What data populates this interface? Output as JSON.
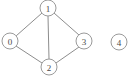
{
  "diagram": {
    "type": "undirected-graph",
    "title": "",
    "width": 133,
    "height": 80,
    "background_color": "#ffffff",
    "node_fill_color": "#ffffff",
    "node_stroke_color": "#9a9a9a",
    "node_label_color": "#4a4a4a",
    "edge_color": "#8d8d8d",
    "node_radius": 8,
    "nodes": [
      {
        "id": "0",
        "label": "0",
        "cx": 10,
        "cy": 41,
        "r": 8
      },
      {
        "id": "1",
        "label": "1",
        "cx": 48,
        "cy": 8,
        "r": 8
      },
      {
        "id": "2",
        "label": "2",
        "cx": 49,
        "cy": 67,
        "r": 8
      },
      {
        "id": "3",
        "label": "3",
        "cx": 84,
        "cy": 41,
        "r": 8
      },
      {
        "id": "4",
        "label": "4",
        "cx": 119,
        "cy": 42,
        "r": 8
      }
    ],
    "edges": [
      {
        "source": "0",
        "target": "1",
        "x1": 16,
        "y1": 36,
        "x2": 42,
        "y2": 13
      },
      {
        "source": "0",
        "target": "2",
        "x1": 16,
        "y1": 46,
        "x2": 42,
        "y2": 63
      },
      {
        "source": "1",
        "target": "2",
        "x1": 48,
        "y1": 16,
        "x2": 49,
        "y2": 59
      },
      {
        "source": "1",
        "target": "3",
        "x1": 54,
        "y1": 13,
        "x2": 79,
        "y2": 35
      },
      {
        "source": "2",
        "target": "3",
        "x1": 56,
        "y1": 63,
        "x2": 79,
        "y2": 47
      }
    ],
    "isolated_nodes": [
      "4"
    ]
  }
}
